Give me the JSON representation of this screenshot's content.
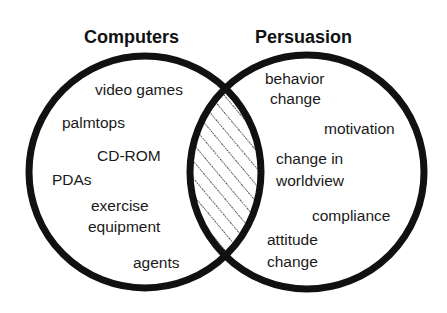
{
  "diagram": {
    "type": "venn",
    "colors": {
      "background": "#ffffff",
      "stroke": "#111111",
      "text": "#1a1a1a",
      "hatch": "#222222"
    },
    "sets": [
      {
        "title": "Computers",
        "items": [
          "video games",
          "palmtops",
          "CD-ROM",
          "PDAs",
          "exercise equipment",
          "agents"
        ]
      },
      {
        "title": "Persuasion",
        "items": [
          "behavior change",
          "motivation",
          "change in worldview",
          "compliance",
          "attitude change"
        ]
      }
    ],
    "intersection": {
      "fill": "diagonal-hatch"
    }
  },
  "labels": {
    "computers_title": "Computers",
    "persuasion_title": "Persuasion",
    "video_games": "video games",
    "palmtops": "palmtops",
    "cd_rom": "CD-ROM",
    "pdas": "PDAs",
    "exercise": "exercise",
    "equipment": "equipment",
    "agents": "agents",
    "behavior": "behavior",
    "behavior_change": "change",
    "motivation": "motivation",
    "change_in": "change in",
    "worldview": "worldview",
    "compliance": "compliance",
    "attitude": "attitude",
    "attitude_change": "change"
  }
}
